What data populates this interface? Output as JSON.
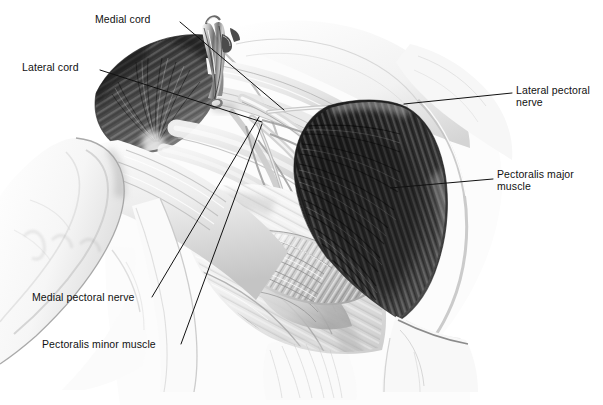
{
  "figure": {
    "kind": "anatomical-illustration",
    "style": "grayscale pencil / airbrush medical illustration",
    "background_color": "#ffffff",
    "ink_color": "#111111",
    "width": 603,
    "height": 405
  },
  "labels": [
    {
      "id": "medial-cord",
      "text": "Medial cord",
      "x": 95,
      "y": 13,
      "leader": {
        "x1": 180,
        "y1": 22,
        "x2": 284,
        "y2": 110
      }
    },
    {
      "id": "lateral-cord",
      "text": "Lateral cord",
      "x": 22,
      "y": 61,
      "leader": {
        "x1": 100,
        "y1": 70,
        "x2": 262,
        "y2": 122
      }
    },
    {
      "id": "lateral-pectoral-nerve",
      "text": "Lateral pectoral\nnerve",
      "x": 516,
      "y": 84,
      "leader": {
        "x1": 512,
        "y1": 93,
        "x2": 404,
        "y2": 104
      }
    },
    {
      "id": "pectoralis-major-muscle",
      "text": "Pectoralis major\nmuscle",
      "x": 497,
      "y": 168,
      "leader": {
        "x1": 493,
        "y1": 179,
        "x2": 390,
        "y2": 188
      }
    },
    {
      "id": "medial-pectoral-nerve",
      "text": "Medial pectoral nerve",
      "x": 32,
      "y": 291,
      "leader": {
        "x1": 152,
        "y1": 297,
        "x2": 259,
        "y2": 117
      }
    },
    {
      "id": "pectoralis-minor-muscle",
      "text": "Pectoralis minor muscle",
      "x": 42,
      "y": 338,
      "leader": {
        "x1": 181,
        "y1": 344,
        "x2": 262,
        "y2": 124
      }
    }
  ],
  "structures": [
    {
      "id": "deltoid-muscle",
      "note": "large dark fan-shaped muscle, upper left"
    },
    {
      "id": "pectoralis-major-muscle",
      "note": "large dark fan-shaped striated muscle, right of centre"
    },
    {
      "id": "pectoralis-minor-muscle",
      "note": "pale fan-shaped muscle, lower centre"
    },
    {
      "id": "arm-drape",
      "note": "white surgical drape over upper arm, left"
    },
    {
      "id": "chest-wall",
      "note": "pale chest wall and ribs, lower right"
    },
    {
      "id": "retractor",
      "note": "metal surgical retractor at top centre"
    },
    {
      "id": "brachial-plexus-cords",
      "note": "pale cord-like nerve bundles running obliquely through the centre"
    },
    {
      "id": "axillary-vessels",
      "note": "pale tubular vessels beneath the clavicle"
    }
  ]
}
